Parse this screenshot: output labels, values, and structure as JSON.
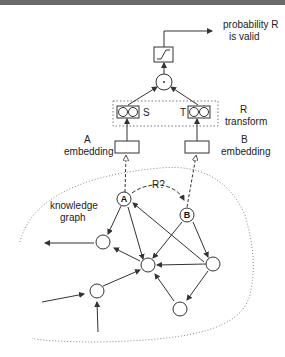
{
  "diagram": {
    "output_label_line1": "probability R",
    "output_label_line2": "is valid",
    "transform_label_line1": "R",
    "transform_label_line2": "transform",
    "s_label": "S",
    "t_label": "T",
    "a_embedding_line1": "A",
    "a_embedding_line2": "embedding",
    "b_embedding_line1": "B",
    "b_embedding_line2": "embedding",
    "relation_query_label": "R?",
    "node_a_label": "A",
    "node_b_label": "B",
    "graph_label_line1": "knowledge",
    "graph_label_line2": "graph",
    "dot_operator": "·"
  },
  "colors": {
    "stroke": "#333333",
    "dotted": "#888888",
    "topbar": "#6a6a6a"
  }
}
